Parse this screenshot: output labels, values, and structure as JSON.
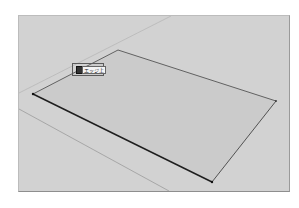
{
  "viewport": {
    "background_color": "#d2d2d2",
    "face_color": "#cbcbcb",
    "edge_color": "#2a2a2a"
  },
  "rectangle": {
    "vertices": {
      "left": [
        14,
        78
      ],
      "top": [
        99,
        34
      ],
      "right": [
        257,
        85
      ],
      "bottom": [
        193,
        166
      ]
    }
  },
  "guide_lines": [
    {
      "from": [
        0,
        77
      ],
      "to": [
        152,
        0
      ]
    },
    {
      "from": [
        0,
        93
      ],
      "to": [
        150,
        175
      ]
    }
  ],
  "inference_tooltip": {
    "label": "エッジ上",
    "icon": "pencil-cursor-icon"
  }
}
